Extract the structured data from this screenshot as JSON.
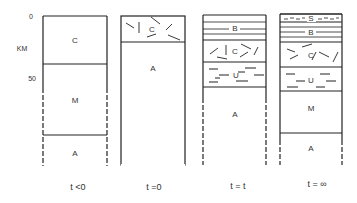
{
  "axis": {
    "unit": "KM",
    "ticks": [
      "0",
      "50"
    ]
  },
  "columns": [
    {
      "label": "t <0",
      "layers": [
        {
          "name": "C",
          "pattern": "plain"
        },
        {
          "name": "M",
          "pattern": "plain"
        },
        {
          "name": "A",
          "pattern": "plain"
        }
      ]
    },
    {
      "label": "t =0",
      "layers": [
        {
          "name": "C",
          "pattern": "fractured"
        },
        {
          "name": "A",
          "pattern": "plain"
        }
      ]
    },
    {
      "label": "t = t",
      "layers": [
        {
          "name": "B",
          "pattern": "horizontal-lines"
        },
        {
          "name": "C",
          "pattern": "fractured"
        },
        {
          "name": "U",
          "pattern": "dashes"
        },
        {
          "name": "A",
          "pattern": "plain"
        }
      ]
    },
    {
      "label": "t = ∞",
      "layers": [
        {
          "name": "S",
          "pattern": "fine-dashes"
        },
        {
          "name": "B",
          "pattern": "horizontal-lines"
        },
        {
          "name": "C",
          "pattern": "fractured"
        },
        {
          "name": "U",
          "pattern": "dashes"
        },
        {
          "name": "M",
          "pattern": "plain"
        },
        {
          "name": "A",
          "pattern": "plain"
        }
      ]
    }
  ]
}
